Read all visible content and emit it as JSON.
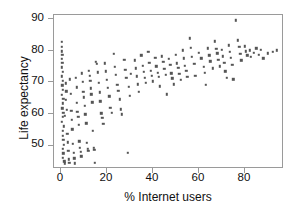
{
  "chart_data": {
    "type": "scatter",
    "title": "",
    "xlabel": "% Internet users",
    "ylabel": "Life expectancy",
    "xlim": [
      -3,
      97
    ],
    "ylim": [
      47.5,
      90.5
    ],
    "xticks": [
      0,
      20,
      40,
      60,
      80
    ],
    "yticks": [
      50,
      60,
      70,
      80,
      90
    ],
    "grid": false,
    "legend": "none",
    "marker_color": "#555555",
    "marker_size_px": 2.4,
    "n_points": 181,
    "points": [
      [
        0.3,
        83.0
      ],
      [
        0.4,
        81.6
      ],
      [
        0.5,
        80.4
      ],
      [
        0.6,
        79.4
      ],
      [
        0.5,
        78.3
      ],
      [
        0.6,
        77.1
      ],
      [
        0.4,
        75.9
      ],
      [
        0.7,
        74.6
      ],
      [
        0.5,
        73.4
      ],
      [
        0.8,
        72.1
      ],
      [
        0.6,
        70.9
      ],
      [
        0.9,
        69.6
      ],
      [
        0.5,
        68.3
      ],
      [
        1.0,
        67.1
      ],
      [
        0.7,
        65.8
      ],
      [
        0.6,
        64.5
      ],
      [
        1.1,
        63.2
      ],
      [
        0.8,
        62.0
      ],
      [
        0.5,
        60.7
      ],
      [
        1.2,
        59.4
      ],
      [
        0.9,
        58.1
      ],
      [
        0.7,
        56.8
      ],
      [
        1.0,
        55.6
      ],
      [
        1.3,
        54.3
      ],
      [
        0.8,
        53.1
      ],
      [
        1.1,
        51.9
      ],
      [
        0.9,
        50.6
      ],
      [
        1.4,
        49.6
      ],
      [
        1.6,
        49.1
      ],
      [
        1.8,
        62.3
      ],
      [
        2.0,
        66.8
      ],
      [
        2.2,
        71.4
      ],
      [
        2.4,
        69.2
      ],
      [
        2.6,
        64.1
      ],
      [
        2.8,
        57.4
      ],
      [
        3.0,
        55.0
      ],
      [
        3.2,
        52.6
      ],
      [
        3.4,
        50.2
      ],
      [
        3.6,
        49.3
      ],
      [
        4.0,
        72.6
      ],
      [
        4.2,
        68.5
      ],
      [
        4.5,
        63.7
      ],
      [
        4.8,
        61.2
      ],
      [
        5.0,
        58.6
      ],
      [
        5.2,
        54.5
      ],
      [
        5.5,
        52.0
      ],
      [
        5.8,
        50.5
      ],
      [
        6.0,
        49.1
      ],
      [
        6.4,
        73.0
      ],
      [
        6.8,
        70.3
      ],
      [
        7.0,
        66.0
      ],
      [
        7.2,
        63.4
      ],
      [
        7.5,
        62.1
      ],
      [
        7.8,
        59.9
      ],
      [
        8.0,
        55.2
      ],
      [
        8.3,
        53.4
      ],
      [
        8.6,
        52.3
      ],
      [
        8.9,
        51.0
      ],
      [
        9.2,
        74.2
      ],
      [
        9.5,
        71.8
      ],
      [
        9.8,
        69.0
      ],
      [
        10.0,
        67.5
      ],
      [
        10.3,
        65.2
      ],
      [
        10.6,
        62.8
      ],
      [
        11.0,
        60.3
      ],
      [
        11.3,
        54.8
      ],
      [
        11.6,
        53.2
      ],
      [
        11.9,
        52.5
      ],
      [
        12.2,
        75.0
      ],
      [
        12.5,
        73.6
      ],
      [
        12.8,
        72.2
      ],
      [
        13.0,
        70.0
      ],
      [
        13.3,
        68.4
      ],
      [
        13.6,
        66.1
      ],
      [
        13.9,
        58.2
      ],
      [
        14.2,
        53.5
      ],
      [
        14.5,
        52.8
      ],
      [
        14.8,
        49.2
      ],
      [
        15.2,
        77.4
      ],
      [
        15.6,
        76.8
      ],
      [
        16.0,
        74.5
      ],
      [
        16.4,
        71.6
      ],
      [
        16.8,
        68.9
      ],
      [
        17.2,
        66.4
      ],
      [
        17.6,
        63.0
      ],
      [
        18.0,
        61.8
      ],
      [
        18.5,
        60.2
      ],
      [
        19.0,
        77.0
      ],
      [
        19.5,
        74.8
      ],
      [
        20.0,
        72.4
      ],
      [
        20.5,
        70.1
      ],
      [
        21.0,
        67.8
      ],
      [
        21.5,
        64.6
      ],
      [
        22.0,
        63.2
      ],
      [
        23.0,
        79.6
      ],
      [
        23.5,
        76.0
      ],
      [
        24.0,
        73.8
      ],
      [
        24.5,
        71.0
      ],
      [
        25.0,
        69.3
      ],
      [
        25.5,
        67.0
      ],
      [
        26.0,
        64.2
      ],
      [
        26.5,
        62.8
      ],
      [
        27.5,
        78.0
      ],
      [
        28.0,
        75.2
      ],
      [
        28.5,
        73.0
      ],
      [
        29.0,
        52.0
      ],
      [
        29.5,
        70.4
      ],
      [
        30.0,
        68.0
      ],
      [
        30.5,
        74.0
      ],
      [
        32.0,
        77.8
      ],
      [
        32.5,
        75.6
      ],
      [
        33.0,
        73.4
      ],
      [
        33.5,
        71.2
      ],
      [
        34.0,
        69.0
      ],
      [
        35.0,
        79.2
      ],
      [
        35.5,
        76.4
      ],
      [
        36.0,
        74.6
      ],
      [
        36.5,
        73.0
      ],
      [
        37.0,
        71.5
      ],
      [
        38.0,
        80.2
      ],
      [
        38.5,
        77.2
      ],
      [
        39.0,
        75.0
      ],
      [
        39.5,
        73.6
      ],
      [
        40.0,
        72.0
      ],
      [
        41.0,
        78.6
      ],
      [
        41.5,
        76.2
      ],
      [
        42.0,
        74.4
      ],
      [
        42.5,
        73.2
      ],
      [
        43.0,
        70.6
      ],
      [
        44.0,
        79.0
      ],
      [
        44.5,
        77.4
      ],
      [
        45.0,
        75.4
      ],
      [
        45.5,
        73.8
      ],
      [
        46.0,
        68.4
      ],
      [
        47.0,
        78.2
      ],
      [
        47.5,
        76.6
      ],
      [
        48.0,
        74.2
      ],
      [
        48.5,
        72.8
      ],
      [
        49.0,
        71.2
      ],
      [
        50.0,
        79.4
      ],
      [
        50.5,
        77.0
      ],
      [
        51.0,
        75.8
      ],
      [
        51.5,
        74.0
      ],
      [
        52.0,
        72.4
      ],
      [
        53.0,
        80.6
      ],
      [
        53.5,
        78.4
      ],
      [
        54.0,
        76.4
      ],
      [
        54.5,
        75.0
      ],
      [
        55.0,
        73.2
      ],
      [
        56.0,
        84.0
      ],
      [
        56.5,
        81.4
      ],
      [
        57.0,
        78.8
      ],
      [
        58.0,
        76.8
      ],
      [
        58.5,
        73.6
      ],
      [
        60.0,
        80.0
      ],
      [
        61.0,
        78.4
      ],
      [
        62.0,
        76.0
      ],
      [
        62.5,
        74.4
      ],
      [
        63.0,
        71.0
      ],
      [
        64.0,
        81.2
      ],
      [
        64.5,
        79.2
      ],
      [
        65.0,
        77.6
      ],
      [
        66.0,
        75.6
      ],
      [
        67.0,
        83.2
      ],
      [
        67.5,
        81.0
      ],
      [
        68.0,
        79.8
      ],
      [
        68.5,
        78.0
      ],
      [
        69.0,
        76.2
      ],
      [
        70.0,
        80.8
      ],
      [
        70.5,
        79.0
      ],
      [
        71.0,
        77.2
      ],
      [
        71.5,
        74.8
      ],
      [
        72.0,
        73.0
      ],
      [
        73.0,
        82.0
      ],
      [
        73.5,
        80.2
      ],
      [
        74.0,
        78.6
      ],
      [
        74.5,
        76.6
      ],
      [
        75.0,
        72.6
      ],
      [
        76.0,
        89.0
      ],
      [
        77.0,
        83.4
      ],
      [
        77.5,
        81.6
      ],
      [
        78.0,
        79.6
      ],
      [
        78.5,
        77.8
      ],
      [
        80.0,
        81.8
      ],
      [
        80.5,
        80.4
      ],
      [
        81.0,
        79.2
      ],
      [
        82.0,
        80.6
      ],
      [
        82.5,
        78.8
      ],
      [
        84.0,
        80.0
      ],
      [
        85.0,
        81.2
      ],
      [
        86.0,
        79.4
      ],
      [
        87.0,
        80.8
      ],
      [
        88.0,
        78.4
      ],
      [
        90.0,
        79.8
      ],
      [
        92.0,
        80.2
      ],
      [
        94.0,
        80.6
      ]
    ]
  }
}
